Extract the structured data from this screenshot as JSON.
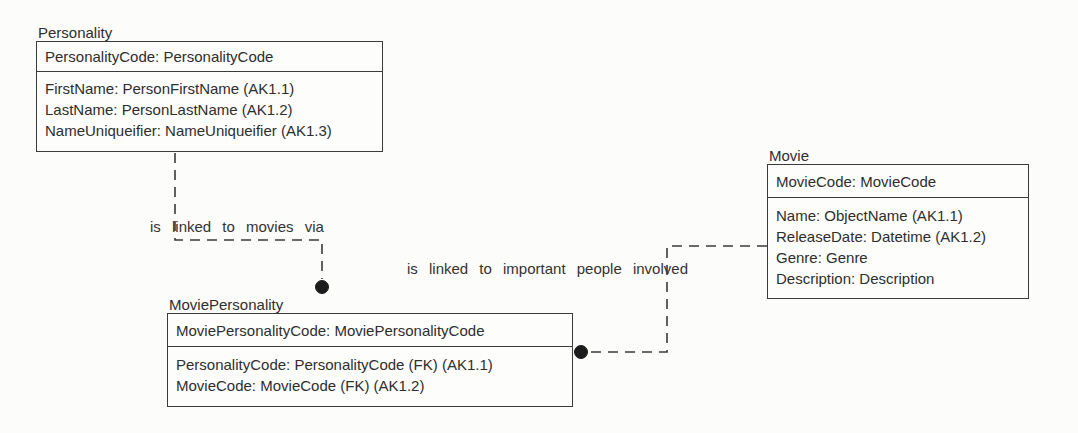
{
  "diagram": {
    "type": "entity-relationship-diagram",
    "notation": "ERwin / IDEF1X style: dashed non-identifying relationship lines with a filled dot at the child (many) end; entity name above box; key area above horizontal divider",
    "entities": [
      {
        "id": "personality",
        "title": "Personality",
        "key_attributes": [
          "PersonalityCode: PersonalityCode"
        ],
        "attributes": [
          "FirstName: PersonFirstName (AK1.1)",
          "LastName: PersonLastName (AK1.2)",
          "NameUniqueifier: NameUniqueifier (AK1.3)"
        ]
      },
      {
        "id": "movie",
        "title": "Movie",
        "key_attributes": [
          "MovieCode: MovieCode"
        ],
        "attributes": [
          "Name: ObjectName (AK1.1)",
          "ReleaseDate: Datetime (AK1.2)",
          "Genre: Genre",
          "Description: Description"
        ]
      },
      {
        "id": "movie-personality",
        "title": "MoviePersonality",
        "key_attributes": [
          "MoviePersonalityCode: MoviePersonalityCode"
        ],
        "attributes": [
          "PersonalityCode: PersonalityCode (FK) (AK1.1)",
          "MovieCode: MovieCode (FK) (AK1.2)"
        ]
      }
    ],
    "relationships": [
      {
        "parent": "Personality",
        "child": "MoviePersonality",
        "label": "is linked to movies via",
        "line_style": "dashed",
        "child_end": "filled-dot"
      },
      {
        "parent": "Movie",
        "child": "MoviePersonality",
        "label": "is linked to important people involved",
        "line_style": "dashed",
        "child_end": "filled-dot"
      }
    ],
    "colors": {
      "background": "#fcfcfa",
      "line": "#3a3a3a",
      "text": "#2e2e2e",
      "box_fill": "#fdfdfc",
      "dot": "#1c1c1c"
    }
  }
}
